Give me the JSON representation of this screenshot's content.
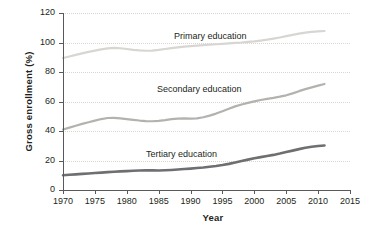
{
  "chart_data": {
    "type": "line",
    "title": "",
    "xlabel": "Year",
    "ylabel": "Gross enrollment (%)",
    "xlim": [
      1970,
      2015
    ],
    "ylim": [
      0,
      120
    ],
    "xticks": [
      1970,
      1975,
      1980,
      1985,
      1990,
      1995,
      2000,
      2005,
      2010,
      2015
    ],
    "yticks": [
      0,
      20,
      40,
      60,
      80,
      100,
      120
    ],
    "grid": "horizontal-dotted",
    "legend": "inline-annotations",
    "x": [
      1970,
      1971,
      1972,
      1973,
      1974,
      1975,
      1976,
      1977,
      1978,
      1979,
      1980,
      1981,
      1982,
      1983,
      1984,
      1985,
      1986,
      1987,
      1988,
      1989,
      1990,
      1991,
      1992,
      1993,
      1994,
      1995,
      1996,
      1997,
      1998,
      1999,
      2000,
      2001,
      2002,
      2003,
      2004,
      2005,
      2006,
      2007,
      2008,
      2009,
      2010,
      2011
    ],
    "series": [
      {
        "name": "Primary education",
        "color": "#d8d6d2",
        "width": 2.2,
        "values": [
          89.5,
          90.5,
          91.6,
          92.6,
          93.6,
          94.5,
          95.3,
          96.0,
          96.3,
          96.1,
          95.6,
          95.0,
          94.6,
          94.4,
          94.5,
          95.0,
          95.6,
          96.2,
          96.7,
          97.2,
          97.6,
          97.9,
          98.2,
          98.5,
          98.8,
          99.1,
          99.4,
          99.7,
          100.0,
          100.4,
          100.8,
          101.3,
          101.9,
          102.6,
          103.4,
          104.3,
          105.2,
          106.0,
          106.7,
          107.2,
          107.6,
          107.8
        ]
      },
      {
        "name": "Secondary education",
        "color": "#b4b2ae",
        "width": 2.2,
        "values": [
          41.0,
          42.3,
          43.6,
          44.8,
          45.9,
          47.0,
          48.1,
          48.8,
          48.9,
          48.6,
          48.1,
          47.6,
          47.1,
          46.7,
          46.6,
          46.9,
          47.4,
          48.0,
          48.4,
          48.5,
          48.4,
          48.6,
          49.3,
          50.4,
          51.8,
          53.4,
          55.1,
          56.7,
          58.0,
          59.1,
          60.1,
          61.0,
          61.8,
          62.5,
          63.3,
          64.2,
          65.5,
          67.0,
          68.4,
          69.6,
          70.8,
          71.9
        ]
      },
      {
        "name": "Tertiary education",
        "color": "#6e6f71",
        "width": 2.6,
        "values": [
          10.0,
          10.3,
          10.6,
          10.9,
          11.2,
          11.5,
          11.8,
          12.1,
          12.4,
          12.6,
          12.8,
          13.0,
          13.2,
          13.4,
          13.3,
          13.2,
          13.4,
          13.6,
          13.9,
          14.2,
          14.5,
          14.9,
          15.3,
          15.8,
          16.3,
          16.9,
          17.7,
          18.6,
          19.6,
          20.6,
          21.5,
          22.3,
          23.0,
          23.8,
          24.7,
          25.7,
          26.7,
          27.7,
          28.6,
          29.3,
          29.8,
          30.2
        ]
      }
    ]
  },
  "axis": {
    "y_tick_labels": [
      "0",
      "20",
      "40",
      "60",
      "80",
      "100",
      "120"
    ],
    "x_tick_labels": [
      "1970",
      "1975",
      "1980",
      "1985",
      "1990",
      "1995",
      "2000",
      "2005",
      "2010",
      "2015"
    ]
  },
  "annotations": {
    "primary": "Primary education",
    "secondary": "Secondary education",
    "tertiary": "Tertiary education"
  }
}
